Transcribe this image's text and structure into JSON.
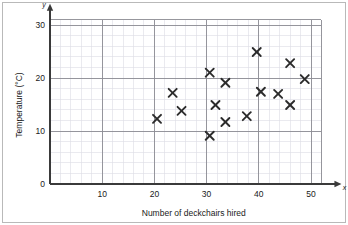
{
  "figure": {
    "background_color": "#ffffff",
    "frame_color": "#b9b9b9",
    "grid_minor_color": "#dcdce4",
    "grid_major_color": "#8c8c92",
    "axis_color": "#3a3a3a",
    "marker_color": "#2b2b2b"
  },
  "chart_data": {
    "type": "scatter",
    "title": "",
    "xlabel": "Number of deckchairs hired",
    "ylabel": "Temperature (°C)",
    "x_axis_letter": "x",
    "y_axis_letter": "y",
    "xlim": [
      0,
      52
    ],
    "ylim": [
      0,
      31
    ],
    "xticks": [
      10,
      20,
      30,
      40,
      50
    ],
    "xtick_labels": [
      "10",
      "20",
      "30",
      "40",
      "50"
    ],
    "yticks": [
      0,
      10,
      20,
      30
    ],
    "ytick_labels": [
      "0",
      "10",
      "20",
      "30"
    ],
    "grid": true,
    "grid_minor_step_x": 2,
    "grid_minor_step_y": 2,
    "grid_major_step_x": 10,
    "grid_major_step_y": 10,
    "legend": null,
    "marker": "x",
    "points": [
      {
        "x": 20.5,
        "y": 12.3
      },
      {
        "x": 23.5,
        "y": 17.2
      },
      {
        "x": 25.2,
        "y": 13.8
      },
      {
        "x": 30.6,
        "y": 21.0
      },
      {
        "x": 30.6,
        "y": 9.1
      },
      {
        "x": 31.7,
        "y": 14.9
      },
      {
        "x": 33.6,
        "y": 19.1
      },
      {
        "x": 33.6,
        "y": 11.7
      },
      {
        "x": 37.7,
        "y": 12.8
      },
      {
        "x": 39.6,
        "y": 24.9
      },
      {
        "x": 40.4,
        "y": 17.4
      },
      {
        "x": 43.7,
        "y": 17.0
      },
      {
        "x": 46.0,
        "y": 22.8
      },
      {
        "x": 46.0,
        "y": 14.9
      },
      {
        "x": 48.8,
        "y": 19.8
      }
    ]
  }
}
